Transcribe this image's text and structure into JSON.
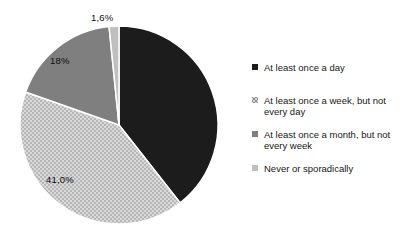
{
  "chart_data": {
    "type": "pie",
    "legend_position": "right",
    "direction": "clockwise",
    "start_angle_deg": 0,
    "number_format": "comma-decimal",
    "slices": [
      {
        "label": "At least once a day",
        "value": 39.4,
        "display_label": "",
        "color": "#1c1c1c",
        "pattern": "solid"
      },
      {
        "label": "At least once a week, but not every day",
        "value": 41.0,
        "display_label": "41,0%",
        "color": "#d9d9d9",
        "pattern": "dots",
        "dot_color": "#8c8c8c"
      },
      {
        "label": "At least once a month, but not every week",
        "value": 18.0,
        "display_label": "18%",
        "color": "#7f7f7f",
        "pattern": "solid"
      },
      {
        "label": "Never or sporadically",
        "value": 1.6,
        "display_label": "1,6%",
        "color": "#bfbfbf",
        "pattern": "solid"
      }
    ]
  }
}
